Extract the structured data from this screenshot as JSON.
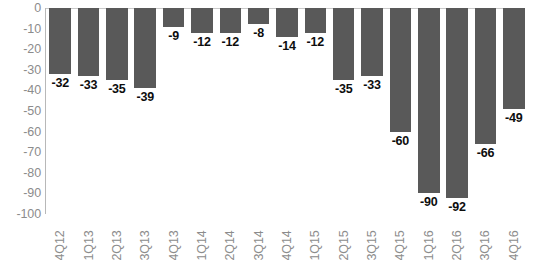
{
  "chart_data": {
    "type": "bar",
    "title": "",
    "subtitle": "",
    "xlabel": "",
    "ylabel": "",
    "orientation": "vertical",
    "grid": false,
    "legend": null,
    "ylim": [
      -100,
      0
    ],
    "ytick_step": 10,
    "ytick_labels": [
      "0",
      "-10",
      "-20",
      "-30",
      "-40",
      "-50",
      "-60",
      "-70",
      "-80",
      "-90",
      "-100"
    ],
    "ytick_values": [
      0,
      -10,
      -20,
      -30,
      -40,
      -50,
      -60,
      -70,
      -80,
      -90,
      -100
    ],
    "categories": [
      "4Q12",
      "1Q13",
      "2Q13",
      "3Q13",
      "4Q13",
      "1Q14",
      "2Q14",
      "3Q14",
      "4Q14",
      "1Q15",
      "2Q15",
      "3Q15",
      "4Q15",
      "1Q16",
      "2Q16",
      "3Q16",
      "4Q16"
    ],
    "values": [
      -32,
      -33,
      -35,
      -39,
      -9,
      -12,
      -12,
      -8,
      -14,
      -12,
      -35,
      -33,
      -60,
      -90,
      -92,
      -66,
      -49
    ],
    "data_labels": [
      "-32",
      "-33",
      "-35",
      "-39",
      "-9",
      "-12",
      "-12",
      "-8",
      "-14",
      "-12",
      "-35",
      "-33",
      "-60",
      "-90",
      "-92",
      "-66",
      "-49"
    ],
    "bar_color": "#595959",
    "axis_color": "#b8b8b8",
    "tick_label_color": "#8c8c8c",
    "data_label_color": "#0d0d0d",
    "background_color": "#ffffff"
  }
}
